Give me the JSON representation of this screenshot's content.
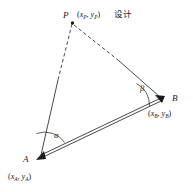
{
  "figure": {
    "kind": "surveying-setting-out-triangle",
    "background_color": "#ffffff",
    "line_color": "#1a1a1a"
  },
  "points": {
    "P": {
      "label": "P",
      "coord_x": "x",
      "coord_x_sub": "P",
      "coord_y": "y",
      "coord_y_sub": "P",
      "coord_text": "(x",
      "note": "设计",
      "px": 72,
      "py": 22
    },
    "A": {
      "label": "A",
      "coord_x": "x",
      "coord_x_sub": "A",
      "coord_y": "y",
      "coord_y_sub": "A",
      "px": 40,
      "py": 157
    },
    "B": {
      "label": "B",
      "coord_x": "x",
      "coord_x_sub": "B",
      "coord_y": "y",
      "coord_y_sub": "B",
      "px": 161,
      "py": 99
    }
  },
  "angles": {
    "alpha": {
      "label": "α",
      "at_vertex": "A"
    },
    "beta": {
      "label": "β",
      "at_vertex": "B"
    }
  },
  "edges": [
    {
      "name": "P-A",
      "from": "P",
      "to": "A",
      "style": "dashed-then-solid"
    },
    {
      "name": "P-B",
      "from": "P",
      "to": "B",
      "style": "dashed-then-solid"
    },
    {
      "name": "A-B",
      "from": "A",
      "to": "B",
      "style": "double-line-baseline"
    }
  ],
  "punctuation": {
    "open_paren": "(",
    "comma": ",",
    "close_paren": ")"
  }
}
